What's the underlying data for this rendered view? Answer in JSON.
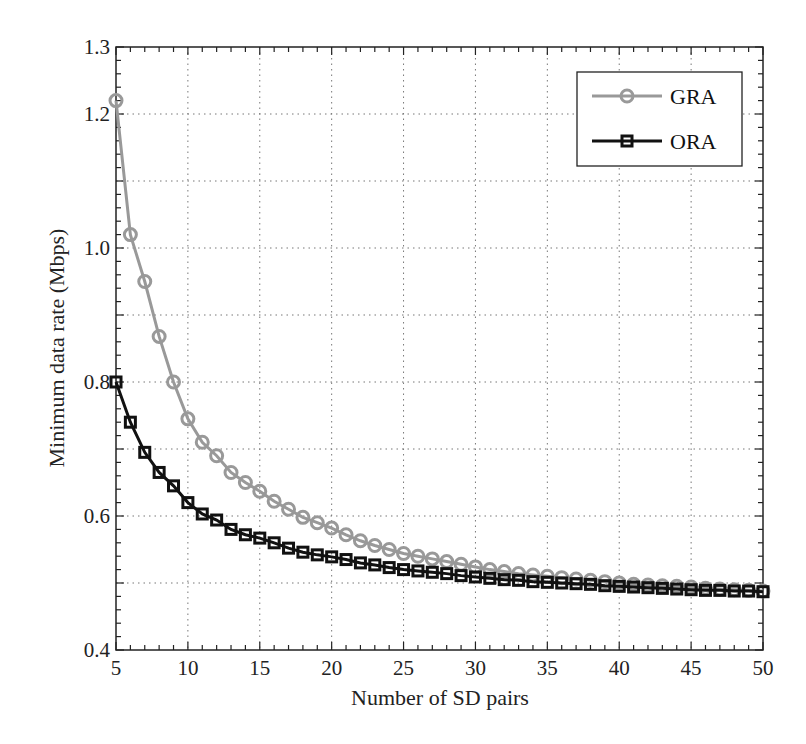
{
  "chart_data": {
    "type": "line",
    "title": "",
    "xlabel": "Number of SD pairs",
    "ylabel": "Minimum data rate (Mbps)",
    "xlim": [
      5,
      50
    ],
    "ylim": [
      0.4,
      1.3
    ],
    "xticks": [
      5,
      10,
      15,
      20,
      25,
      30,
      35,
      40,
      45,
      50
    ],
    "xtick_labels": [
      "5",
      "10",
      "15",
      "20",
      "25",
      "30",
      "35",
      "40",
      "45",
      "50"
    ],
    "yticks": [
      0.4,
      0.6,
      0.8,
      1.0,
      1.2,
      1.3
    ],
    "ytick_labels": [
      "0.4",
      "0.6",
      "0.8",
      "1.0",
      "1.2",
      "1.3"
    ],
    "grid": true,
    "grid_style": "dotted",
    "legend_position": "upper right",
    "x": [
      5,
      6,
      7,
      8,
      9,
      10,
      11,
      12,
      13,
      14,
      15,
      16,
      17,
      18,
      19,
      20,
      21,
      22,
      23,
      24,
      25,
      26,
      27,
      28,
      29,
      30,
      31,
      32,
      33,
      34,
      35,
      36,
      37,
      38,
      39,
      40,
      41,
      42,
      43,
      44,
      45,
      46,
      47,
      48,
      49,
      50
    ],
    "series": [
      {
        "name": "GRA",
        "color": "#999999",
        "marker": "circle",
        "values": [
          1.22,
          1.02,
          0.95,
          0.868,
          0.8,
          0.745,
          0.71,
          0.69,
          0.665,
          0.65,
          0.637,
          0.622,
          0.61,
          0.598,
          0.59,
          0.582,
          0.572,
          0.563,
          0.556,
          0.55,
          0.544,
          0.54,
          0.536,
          0.532,
          0.528,
          0.524,
          0.52,
          0.517,
          0.514,
          0.512,
          0.51,
          0.508,
          0.506,
          0.504,
          0.502,
          0.5,
          0.498,
          0.497,
          0.496,
          0.495,
          0.494,
          0.492,
          0.491,
          0.49,
          0.489,
          0.488
        ]
      },
      {
        "name": "ORA",
        "color": "#111111",
        "marker": "square",
        "values": [
          0.8,
          0.74,
          0.695,
          0.665,
          0.645,
          0.62,
          0.603,
          0.594,
          0.58,
          0.572,
          0.567,
          0.56,
          0.552,
          0.546,
          0.542,
          0.539,
          0.535,
          0.53,
          0.527,
          0.523,
          0.52,
          0.518,
          0.516,
          0.514,
          0.511,
          0.509,
          0.507,
          0.505,
          0.504,
          0.502,
          0.501,
          0.5,
          0.499,
          0.498,
          0.496,
          0.495,
          0.494,
          0.493,
          0.492,
          0.491,
          0.49,
          0.489,
          0.489,
          0.488,
          0.488,
          0.487
        ]
      }
    ]
  }
}
